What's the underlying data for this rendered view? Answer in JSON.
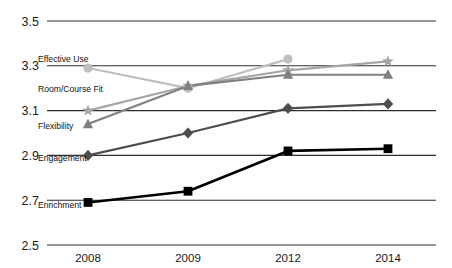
{
  "chart_data": {
    "type": "line",
    "title": "",
    "xlabel": "",
    "ylabel": "",
    "categories": [
      "2008",
      "2009",
      "2012",
      "2014"
    ],
    "ylim": [
      2.5,
      3.5
    ],
    "yticks": [
      "2.5",
      "2.7",
      "2.9",
      "3.1",
      "3.3",
      "3.5"
    ],
    "ytick_values": [
      2.5,
      2.7,
      2.9,
      3.1,
      3.3,
      3.5
    ],
    "grid": true,
    "legend_position": "inline-left",
    "series": [
      {
        "name": "Effective Use",
        "marker": "circle",
        "color": "#bfbfbf",
        "values": [
          3.29,
          3.2,
          3.33,
          null
        ]
      },
      {
        "name": "Room/Course Fit",
        "marker": "star",
        "color": "#a6a6a6",
        "values": [
          3.1,
          3.21,
          3.28,
          3.32
        ]
      },
      {
        "name": "Flexibility",
        "marker": "triangle",
        "color": "#808080",
        "values": [
          3.04,
          3.21,
          3.26,
          3.26
        ]
      },
      {
        "name": "Engagement",
        "marker": "diamond",
        "color": "#4d4d4d",
        "values": [
          2.9,
          3.0,
          3.11,
          3.13
        ]
      },
      {
        "name": "Enrichment",
        "marker": "square",
        "color": "#000000",
        "values": [
          2.69,
          2.74,
          2.92,
          2.93
        ]
      }
    ]
  },
  "style": {
    "background": "#ffffff",
    "gridline_color": "#2e2e2e",
    "tick_color": "#1a1a1a"
  }
}
